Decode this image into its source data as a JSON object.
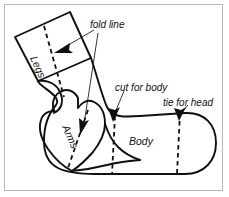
{
  "figure": {
    "kind": "sock-doll-cutting-pattern",
    "border_color": "#b9b9b9",
    "background_color": "#ffffff",
    "outline_color": "#101010",
    "fold_line_style": "dashed"
  },
  "part_labels": {
    "legs": "Legs",
    "arms": "Arms",
    "body": "Body"
  },
  "callouts": {
    "fold_line": "fold line",
    "cut_for_body": "cut for body",
    "tie_for_head": "tie for head"
  }
}
